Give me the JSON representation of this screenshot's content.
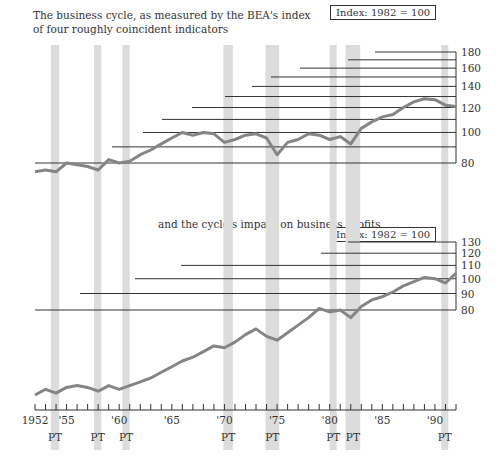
{
  "titles": {
    "top": "The business cycle, as measured by the BEA's index of four roughly coincident indicators",
    "middle": "and the cycle's impact on business profits",
    "index_label_top": "Index: 1982 = 100",
    "index_label_bottom": "Index: 1982 = 100"
  },
  "colors": {
    "line": "#858585",
    "recession": "#dcdcdc",
    "grid": "#333333",
    "text": "#333333"
  },
  "chart_data": [
    {
      "type": "line",
      "title": "The business cycle, as measured by the BEA's index of four roughly coincident indicators",
      "ylabel": "Index: 1982 = 100",
      "scale": "log",
      "ylim": [
        80,
        180
      ],
      "yticks": [
        180,
        160,
        140,
        120,
        100,
        80
      ],
      "gridlines": [
        180,
        170,
        160,
        150,
        140,
        130,
        120,
        110,
        100,
        90,
        80
      ],
      "x": [
        1952,
        1953,
        1954,
        1955,
        1956,
        1957,
        1958,
        1959,
        1960,
        1961,
        1962,
        1963,
        1964,
        1965,
        1966,
        1967,
        1968,
        1969,
        1970,
        1971,
        1972,
        1973,
        1974,
        1975,
        1976,
        1977,
        1978,
        1979,
        1980,
        1981,
        1982,
        1983,
        1984,
        1985,
        1986,
        1987,
        1988,
        1989,
        1990,
        1991,
        1992
      ],
      "values": [
        75,
        76,
        75,
        80,
        79,
        78,
        76,
        82,
        80,
        81,
        85,
        88,
        92,
        96,
        100,
        98,
        100,
        99,
        93,
        95,
        98,
        99,
        96,
        85,
        93,
        95,
        99,
        98,
        95,
        97,
        92,
        103,
        108,
        112,
        114,
        120,
        125,
        128,
        127,
        122,
        121
      ],
      "recession_markers": "PT"
    },
    {
      "type": "line",
      "title": "and the cycle's impact on business profits",
      "ylabel": "Index: 1982 = 100",
      "scale": "log",
      "ylim": [
        80,
        130
      ],
      "yticks": [
        130,
        120,
        110,
        100,
        90,
        80
      ],
      "gridlines": [
        130,
        120,
        110,
        100,
        90,
        80
      ],
      "x": [
        1952,
        1953,
        1954,
        1955,
        1956,
        1957,
        1958,
        1959,
        1960,
        1961,
        1962,
        1963,
        1964,
        1965,
        1966,
        1967,
        1968,
        1969,
        1970,
        1971,
        1972,
        1973,
        1974,
        1975,
        1976,
        1977,
        1978,
        1979,
        1980,
        1981,
        1982,
        1983,
        1984,
        1985,
        1986,
        1987,
        1988,
        1989,
        1990,
        1991,
        1992
      ],
      "values": [
        35,
        38,
        36,
        39,
        40,
        39,
        37,
        40,
        38,
        40,
        42,
        44,
        47,
        50,
        53,
        55,
        58,
        61,
        60,
        63,
        67,
        70,
        66,
        64,
        68,
        72,
        76,
        81,
        79,
        80,
        76,
        82,
        86,
        88,
        91,
        95,
        98,
        101,
        100,
        97,
        104
      ],
      "recession_markers": "PT"
    }
  ],
  "x_axis": {
    "start_year": 1952,
    "end_year": 1992,
    "labels": [
      {
        "year": 1952,
        "text": "1952"
      },
      {
        "year": 1955,
        "text": "'55"
      },
      {
        "year": 1960,
        "text": "'60"
      },
      {
        "year": 1965,
        "text": "'65"
      },
      {
        "year": 1970,
        "text": "'70"
      },
      {
        "year": 1975,
        "text": "'75"
      },
      {
        "year": 1980,
        "text": "'80"
      },
      {
        "year": 1985,
        "text": "'85"
      },
      {
        "year": 1990,
        "text": "'90"
      }
    ]
  },
  "recessions": [
    {
      "start": 1953.5,
      "end": 1954.3,
      "label": "PT"
    },
    {
      "start": 1957.6,
      "end": 1958.3,
      "label": "PT"
    },
    {
      "start": 1960.3,
      "end": 1961.0,
      "label": "PT"
    },
    {
      "start": 1969.9,
      "end": 1970.8,
      "label": "PT"
    },
    {
      "start": 1973.9,
      "end": 1975.2,
      "label": "PT"
    },
    {
      "start": 1980.0,
      "end": 1980.6,
      "label": "PT"
    },
    {
      "start": 1981.5,
      "end": 1982.9,
      "label": "PT"
    },
    {
      "start": 1990.6,
      "end": 1991.2,
      "label": "PT"
    }
  ]
}
